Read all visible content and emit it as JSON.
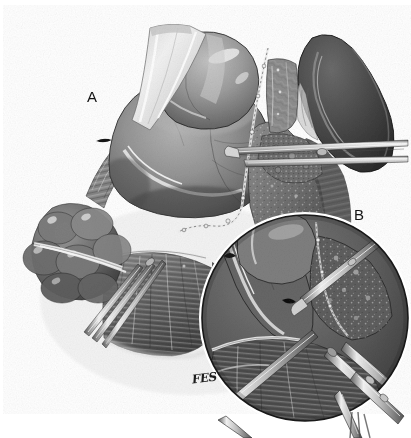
{
  "figure": {
    "kind": "medical-surgical-illustration",
    "medium": "grayscale pen-and-ink / wash drawing",
    "background_color": "#ffffff",
    "width_px": 411,
    "height_px": 438,
    "panels": [
      {
        "id": "A",
        "label": "A",
        "label_x": 87,
        "label_y": 89,
        "description": "Main overview drawing: retracted stomach body with a pale tape/retractor band crossing it, a staple-suture line running diagonally, dark curved bowel loop at upper right, lobulated omental fat at left, fan-shaped mesentery below, and forceps entering from the right and lower left."
      },
      {
        "id": "B",
        "label": "B",
        "label_x": 354,
        "label_y": 207,
        "description": "Circular magnified inset at lower right showing close-up of the dissection plane with two clamps/forceps grasping tissue.",
        "circle_center_x": 305,
        "circle_center_y": 318,
        "circle_radius": 103
      }
    ],
    "signature": {
      "text": "FES",
      "x": 192,
      "y": 371,
      "rotation_deg": -7,
      "note": "artist monogram, cursive"
    },
    "palette": {
      "background": "#ffffff",
      "ink_outline": "#1a1a1a",
      "tissue_darkest": "#3a3a3a",
      "tissue_dark": "#545454",
      "tissue_mid": "#7d7d7d",
      "tissue_light": "#a8a8a8",
      "tissue_highlight": "#e2e2e2",
      "specular_white": "#fafafa",
      "metal_instrument": "#b9b9b9",
      "metal_shadow": "#4d4d4d",
      "tape_band": "#e8e8e8"
    },
    "anatomy_regions": [
      {
        "name": "stomach-body",
        "tone": "#8c8c8c",
        "note": "large mid-gray dome, centre-left, with fine serosal vessels"
      },
      {
        "name": "retractor-tape-band",
        "tone": "#e8e8e8",
        "note": "pale band crossing the stomach at upper left"
      },
      {
        "name": "staple-suture-line",
        "tone": "#e8e8e8",
        "note": "dotted/beaded line running top-centre to lower-centre"
      },
      {
        "name": "duodenal-loop",
        "tone": "#4a4a4a",
        "note": "dark C-shaped loop, upper right"
      },
      {
        "name": "omental-fat-lobules",
        "tone": "#6e6e6e",
        "note": "rounded lobules, left margin"
      },
      {
        "name": "mesentery-fan",
        "tone": "#666666",
        "note": "striated fan-shaped sheet, lower centre"
      },
      {
        "name": "pancreas-surface",
        "tone": "#7a7a7a",
        "note": "stippled granular surface right of the suture line"
      }
    ],
    "instruments": [
      {
        "name": "forceps-right",
        "note": "long forceps entering horizontally from right margin at mid height"
      },
      {
        "name": "forceps-lower-left",
        "note": "two shafts crossing from lower left toward the mesentery"
      },
      {
        "name": "clamp-inset-left",
        "note": "clamp in panel B descending from upper right of circle"
      },
      {
        "name": "clamp-inset-right",
        "note": "toothed clamp in panel B exiting bottom right of circle"
      }
    ]
  }
}
